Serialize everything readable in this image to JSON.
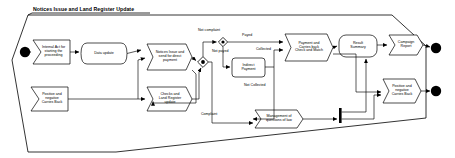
{
  "diagram": {
    "type": "uml-activity-diagram",
    "frame": {
      "title": "Notices Issue and Land Register Update"
    },
    "colors": {
      "stroke": "#000000",
      "fill": "#ffffff",
      "text": "#000000",
      "node_fill": "#ffffff"
    },
    "start_nodes": [
      {
        "id": "start1",
        "name": "start-node-top",
        "cx": 25,
        "cy": 52,
        "r": 5.2
      },
      {
        "id": "start2",
        "name": "start-node-unused",
        "cx": 25,
        "cy": 52,
        "r": 0
      }
    ],
    "end_nodes": [
      {
        "id": "end1",
        "name": "end-node-top",
        "cx": 436,
        "cy": 48,
        "r": 5.2
      },
      {
        "id": "end2",
        "name": "end-node-bottom",
        "cx": 436,
        "cy": 91,
        "r": 5.2
      }
    ],
    "signals": [
      {
        "id": "sig1",
        "label": "Internal Act for\nstarting the\nproceeding",
        "x": 33,
        "y": 40,
        "w": 37,
        "h": 24
      },
      {
        "id": "sig2",
        "label": "Positive and\nnegative\nCarries Back",
        "x": 31,
        "y": 87,
        "w": 37,
        "h": 24
      },
      {
        "id": "sig3",
        "label": "Notices Issue and\nsend for direct\npayment",
        "x": 147,
        "y": 44,
        "w": 45,
        "h": 26
      },
      {
        "id": "sig4",
        "label": "Checks and\nLand Register\nupdate",
        "x": 147,
        "y": 87,
        "w": 45,
        "h": 24
      },
      {
        "id": "sig5",
        "label": "Payment and\nCarries back\nCheck and Match",
        "x": 285,
        "y": 34,
        "w": 48,
        "h": 27
      },
      {
        "id": "sig6",
        "label": "Management of\nquestions of law",
        "x": 255,
        "y": 110,
        "w": 48,
        "h": 18
      },
      {
        "id": "sig7",
        "label": "Positive and\nnegative\nCarries Back",
        "x": 383,
        "y": 79,
        "w": 38,
        "h": 24
      },
      {
        "id": "sig8",
        "label": "Campaign\nReport",
        "x": 389,
        "y": 35,
        "w": 34,
        "h": 20
      }
    ],
    "activities": [
      {
        "id": "act1",
        "label": "Data update",
        "x": 81,
        "y": 43,
        "w": 46,
        "h": 21
      },
      {
        "id": "act2",
        "label": "Indirect\nPayment",
        "x": 232,
        "y": 58,
        "w": 33,
        "h": 19
      },
      {
        "id": "act3",
        "label": "Result\nSummary",
        "x": 339,
        "y": 35,
        "w": 38,
        "h": 22
      }
    ],
    "decisions": [
      {
        "id": "dec1",
        "name": "decision-main",
        "cx": 203,
        "cy": 62,
        "r": 5.4
      },
      {
        "id": "dec2",
        "name": "decision-complaint",
        "cx": 223,
        "cy": 42,
        "r": 4.6
      }
    ],
    "join_bars": [
      {
        "id": "join1",
        "name": "join-bar",
        "x": 339,
        "y": 108,
        "w": 2.6,
        "h": 15
      }
    ],
    "edge_labels": [
      {
        "id": "el1",
        "text": "Not complaint",
        "x": 198,
        "y": 31
      },
      {
        "id": "el2",
        "text": "Payed",
        "x": 242,
        "y": 36
      },
      {
        "id": "el3",
        "text": "Not payed",
        "x": 216,
        "y": 52
      },
      {
        "id": "el4",
        "text": "Collected",
        "x": 259,
        "y": 50
      },
      {
        "id": "el5",
        "text": "Not Collected",
        "x": 247,
        "y": 86
      },
      {
        "id": "el6",
        "text": "Complaint",
        "x": 201,
        "y": 114
      }
    ]
  }
}
